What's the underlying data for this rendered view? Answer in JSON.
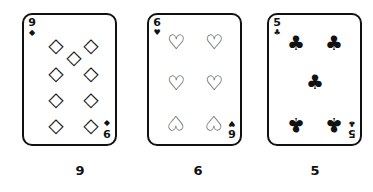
{
  "cards": [
    {
      "rank": "9",
      "suit": "diamonds",
      "suit_glyph": "◇",
      "small_glyph": "◆",
      "caption": "9"
    },
    {
      "rank": "6",
      "suit": "hearts",
      "suit_glyph": "♡",
      "small_glyph": "♥",
      "caption": "6"
    },
    {
      "rank": "5",
      "suit": "clubs",
      "suit_glyph": "♣",
      "small_glyph": "♣",
      "caption": "5"
    }
  ]
}
